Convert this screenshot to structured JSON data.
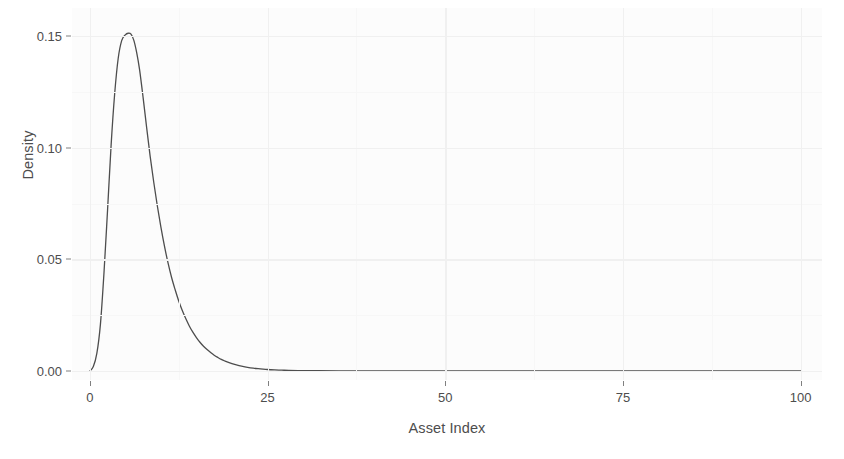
{
  "chart_data": {
    "type": "line",
    "title": "",
    "subtitle": "",
    "xlabel": "Asset Index",
    "ylabel": "Density",
    "xlim": [
      -2.5,
      103
    ],
    "ylim": [
      -0.004,
      0.1625
    ],
    "grid": true,
    "legend": "none",
    "x_ticks": [
      0,
      25,
      50,
      75,
      100
    ],
    "x_tick_labels": [
      "0",
      "25",
      "50",
      "75",
      "100"
    ],
    "y_ticks": [
      0.0,
      0.05,
      0.1,
      0.15
    ],
    "y_tick_labels": [
      "0.00",
      "0.05",
      "0.10",
      "0.15"
    ],
    "x_minor_ticks": [
      12.5,
      37.5,
      62.5,
      87.5
    ],
    "y_minor_ticks": [
      0.025,
      0.075,
      0.125
    ],
    "line_color": "#4d4d4d",
    "line_width": 1.3,
    "panel_background": "#fcfcfc",
    "grid_color_major": "#f0f0f0",
    "grid_color_minor": "#f7f7f7",
    "annotations": [],
    "series": [
      {
        "name": "Asset Index density",
        "x": [
          0.0,
          0.5,
          1.0,
          1.5,
          2.0,
          2.5,
          3.0,
          3.5,
          4.0,
          4.5,
          5.0,
          5.4,
          5.8,
          6.2,
          6.6,
          7.0,
          7.5,
          8.0,
          8.5,
          9.0,
          9.5,
          10.0,
          10.5,
          11.0,
          11.5,
          12.0,
          12.5,
          13.0,
          13.5,
          14.0,
          14.5,
          15.0,
          15.5,
          16.0,
          16.5,
          17.0,
          17.5,
          18.0,
          18.5,
          19.0,
          20.0,
          21.0,
          22.0,
          23.0,
          24.0,
          25.0,
          26.0,
          27.0,
          28.0,
          30.0,
          32.0,
          35.0,
          40.0,
          45.0,
          50.0,
          60.0,
          70.0,
          80.0,
          90.0,
          100.0
        ],
        "y": [
          0.0,
          0.002,
          0.008,
          0.021,
          0.044,
          0.072,
          0.101,
          0.124,
          0.14,
          0.148,
          0.1505,
          0.1512,
          0.1508,
          0.148,
          0.1425,
          0.135,
          0.1225,
          0.109,
          0.096,
          0.0845,
          0.074,
          0.0645,
          0.056,
          0.0485,
          0.042,
          0.0365,
          0.0315,
          0.0272,
          0.0235,
          0.0202,
          0.0174,
          0.015,
          0.0129,
          0.0111,
          0.0096,
          0.0083,
          0.0071,
          0.0061,
          0.0052,
          0.0045,
          0.0033,
          0.0024,
          0.0018,
          0.0013,
          0.001,
          0.0007,
          0.0005,
          0.0004,
          0.0003,
          0.0002,
          0.0002,
          0.0001,
          0.0001,
          0.0001,
          0.0001,
          0.0001,
          0.0001,
          0.0001,
          0.0001,
          0.0001
        ]
      }
    ]
  },
  "axes": {
    "y_title": "Density",
    "x_title": "Asset Index"
  }
}
